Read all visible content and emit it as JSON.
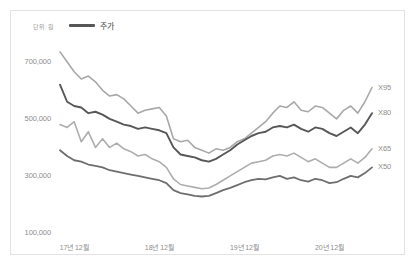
{
  "card": {
    "border_color": "#e3e3e3",
    "background": "#ffffff"
  },
  "legend": {
    "unit_label": "단위: 원",
    "entries": [
      {
        "label": "주가",
        "color": "#575757"
      }
    ]
  },
  "chart_data": {
    "type": "line",
    "title": "",
    "subtitle": "",
    "xlabel": "",
    "ylabel": "단위: 원",
    "grid": false,
    "legend_position": "top-left",
    "ylim": [
      100000,
      780000
    ],
    "yticks": [
      700000,
      500000,
      300000,
      100000
    ],
    "ytick_labels": [
      "700,000",
      "500,000",
      "300,000",
      "100,000"
    ],
    "xticks": [
      2,
      14,
      26,
      38
    ],
    "xtick_labels": [
      "17년 12월",
      "18년 12월",
      "19년 12월",
      "20년 12월"
    ],
    "x": [
      0,
      1,
      2,
      3,
      4,
      5,
      6,
      7,
      8,
      9,
      10,
      11,
      12,
      13,
      14,
      15,
      16,
      17,
      18,
      19,
      20,
      21,
      22,
      23,
      24,
      25,
      26,
      27,
      28,
      29,
      30,
      31,
      32,
      33,
      34,
      35,
      36,
      37,
      38,
      39,
      40,
      41,
      42,
      43,
      44
    ],
    "series": [
      {
        "name": "X95",
        "color": "#a8a8a8",
        "width": 1.6,
        "end_label": "X95",
        "values": [
          735000,
          700000,
          665000,
          640000,
          650000,
          630000,
          600000,
          580000,
          585000,
          570000,
          545000,
          520000,
          530000,
          535000,
          540000,
          510000,
          430000,
          420000,
          425000,
          400000,
          390000,
          380000,
          395000,
          390000,
          400000,
          420000,
          430000,
          450000,
          470000,
          490000,
          520000,
          545000,
          540000,
          560000,
          530000,
          525000,
          545000,
          540000,
          520000,
          500000,
          530000,
          545000,
          520000,
          560000,
          610000
        ]
      },
      {
        "name": "X80",
        "color": "#575757",
        "width": 1.9,
        "end_label": "X80",
        "values": [
          620000,
          560000,
          545000,
          540000,
          520000,
          525000,
          515000,
          500000,
          490000,
          480000,
          475000,
          465000,
          470000,
          465000,
          460000,
          450000,
          400000,
          375000,
          370000,
          365000,
          355000,
          350000,
          360000,
          375000,
          390000,
          410000,
          425000,
          440000,
          450000,
          455000,
          470000,
          475000,
          470000,
          480000,
          465000,
          455000,
          470000,
          465000,
          450000,
          440000,
          455000,
          470000,
          450000,
          480000,
          520000
        ]
      },
      {
        "name": "X65",
        "color": "#adadad",
        "width": 1.6,
        "end_label": "X65",
        "values": [
          480000,
          470000,
          490000,
          420000,
          455000,
          400000,
          430000,
          400000,
          415000,
          395000,
          385000,
          370000,
          375000,
          360000,
          350000,
          330000,
          290000,
          270000,
          265000,
          260000,
          255000,
          258000,
          270000,
          285000,
          300000,
          315000,
          330000,
          345000,
          350000,
          355000,
          370000,
          375000,
          370000,
          380000,
          365000,
          350000,
          360000,
          345000,
          330000,
          330000,
          345000,
          360000,
          345000,
          365000,
          395000
        ]
      },
      {
        "name": "X50",
        "color": "#6e6e6e",
        "width": 1.8,
        "end_label": "X50",
        "values": [
          390000,
          370000,
          355000,
          350000,
          340000,
          335000,
          330000,
          320000,
          315000,
          310000,
          305000,
          300000,
          295000,
          290000,
          285000,
          275000,
          250000,
          240000,
          235000,
          230000,
          228000,
          230000,
          240000,
          250000,
          258000,
          268000,
          278000,
          285000,
          290000,
          288000,
          295000,
          300000,
          290000,
          295000,
          285000,
          280000,
          290000,
          285000,
          275000,
          278000,
          290000,
          300000,
          295000,
          310000,
          330000
        ]
      }
    ]
  }
}
